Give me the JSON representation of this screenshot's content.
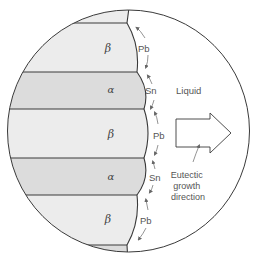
{
  "diagram": {
    "type": "eutectic-lamellar-microstructure",
    "colors": {
      "background": "#ffffff",
      "beta_phase": "#ececec",
      "alpha_phase": "#dcdcdc",
      "outline": "#3a3a3a",
      "text": "#555555",
      "arrow_fill": "#ffffff"
    },
    "phases": [
      {
        "label": "β",
        "name": "beta"
      },
      {
        "label": "α",
        "name": "alpha"
      },
      {
        "label": "β",
        "name": "beta"
      },
      {
        "label": "α",
        "name": "alpha"
      },
      {
        "label": "β",
        "name": "beta"
      }
    ],
    "diffusion_labels": [
      "Pb",
      "Sn",
      "Pb",
      "Sn",
      "Pb"
    ],
    "liquid_label": "Liquid",
    "growth_direction_label": [
      "Eutectic",
      "growth",
      "direction"
    ]
  }
}
